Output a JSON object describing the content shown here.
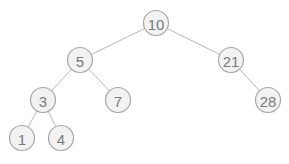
{
  "tree": {
    "nodes": [
      {
        "id": "n10",
        "label": "10",
        "x": 156,
        "y": 23
      },
      {
        "id": "n5",
        "label": "5",
        "x": 80,
        "y": 60
      },
      {
        "id": "n21",
        "label": "21",
        "x": 231,
        "y": 60
      },
      {
        "id": "n3",
        "label": "3",
        "x": 43,
        "y": 100
      },
      {
        "id": "n7",
        "label": "7",
        "x": 118,
        "y": 100
      },
      {
        "id": "n28",
        "label": "28",
        "x": 268,
        "y": 100
      },
      {
        "id": "n1",
        "label": "1",
        "x": 22,
        "y": 138
      },
      {
        "id": "n4",
        "label": "4",
        "x": 61,
        "y": 138
      }
    ],
    "edges": [
      [
        "n10",
        "n5"
      ],
      [
        "n10",
        "n21"
      ],
      [
        "n5",
        "n3"
      ],
      [
        "n5",
        "n7"
      ],
      [
        "n21",
        "n28"
      ],
      [
        "n3",
        "n1"
      ],
      [
        "n3",
        "n4"
      ]
    ],
    "radius": 12.5
  }
}
